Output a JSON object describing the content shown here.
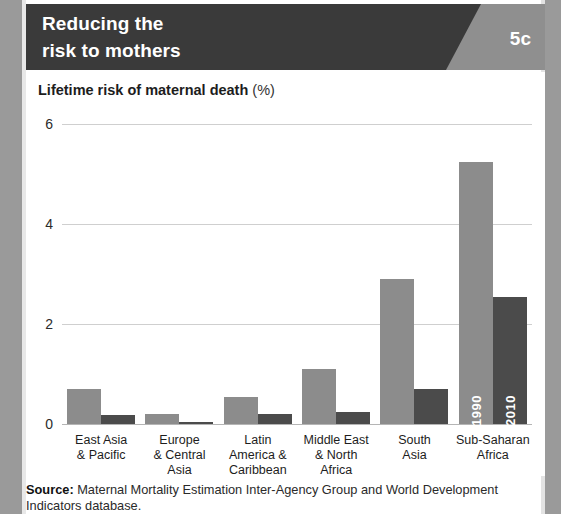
{
  "header": {
    "title_line1": "Reducing the",
    "title_line2": "risk to mothers",
    "badge": "5c"
  },
  "chart_title": {
    "main": "Lifetime risk of maternal death",
    "unit": "(%)"
  },
  "source": {
    "label": "Source:",
    "text": " Maternal Mortality Estimation Inter-Agency Group and World Development Indicators database."
  },
  "colors": {
    "header_dark": "#3a3a3a",
    "header_band": "#8f8f8f",
    "bar_1990": "#8c8c8c",
    "bar_2010": "#4b4b4b",
    "gridline": "#cfcfcf",
    "page_edge": "#9a9a9a"
  },
  "chart_data": {
    "type": "bar",
    "title": "Lifetime risk of maternal death (%)",
    "xlabel": "",
    "ylabel": "",
    "ylim": [
      0,
      6
    ],
    "yticks": [
      0,
      2,
      4,
      6
    ],
    "ytick_labels": [
      "0",
      "2",
      "4",
      "6"
    ],
    "grid": true,
    "legend": "inline bar labels on last group",
    "categories": [
      "East Asia\n& Pacific",
      "Europe\n& Central\nAsia",
      "Latin\nAmerica &\nCaribbean",
      "Middle East\n& North\nAfrica",
      "South\nAsia",
      "Sub-Saharan\nAfrica"
    ],
    "series": [
      {
        "name": "1990",
        "color": "#8c8c8c",
        "values": [
          0.7,
          0.2,
          0.55,
          1.1,
          2.9,
          5.25
        ]
      },
      {
        "name": "2010",
        "color": "#4b4b4b",
        "values": [
          0.18,
          0.05,
          0.2,
          0.25,
          0.7,
          2.55
        ]
      }
    ]
  }
}
